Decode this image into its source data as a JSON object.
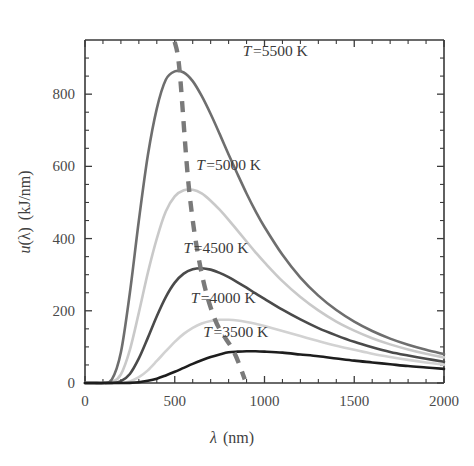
{
  "figure": {
    "background": "#ffffff",
    "plot_box": {
      "left": 85,
      "top": 40,
      "right": 444,
      "bottom": 383
    }
  },
  "axes": {
    "x_title_var": "λ",
    "x_title_unit": "(nm)",
    "y_title": "u(λ)  (kJ/nm)",
    "y_title_var": "u",
    "y_title_arg": "(λ)",
    "y_title_unit": "(kJ/nm)",
    "x_ticklabels": [
      "0",
      "500",
      "1000",
      "1500",
      "2000"
    ],
    "y_ticklabels": [
      "0",
      "200",
      "400",
      "600",
      "800"
    ]
  },
  "chart_data": {
    "type": "line",
    "title": "",
    "xlabel": "λ (nm)",
    "ylabel": "u(λ) (kJ/nm)",
    "xlim": [
      0,
      2000
    ],
    "ylim": [
      0,
      950
    ],
    "xticks": [
      0,
      500,
      1000,
      1500,
      2000
    ],
    "yticks": [
      0,
      200,
      400,
      600,
      800
    ],
    "x_minor_tick_step": 100,
    "y_minor_tick_step": 50,
    "grid": false,
    "legend": "inline-annotations",
    "x": [
      0,
      50,
      100,
      150,
      200,
      250,
      300,
      350,
      400,
      450,
      500,
      550,
      600,
      650,
      700,
      750,
      800,
      850,
      900,
      950,
      1000,
      1100,
      1200,
      1300,
      1400,
      1500,
      1600,
      1700,
      1800,
      1900,
      2000
    ],
    "series": [
      {
        "name": "T=5500 K",
        "temperature_K": 5500,
        "color": "#6e6e6e",
        "linewidth": 2.6,
        "peak": {
          "x": 527,
          "y": 865
        },
        "label": "T = 5500 K",
        "label_pos": {
          "x": 1060,
          "y": 905
        },
        "values": [
          0,
          0,
          0.2,
          10,
          85,
          250,
          450,
          630,
          760,
          840,
          863,
          860,
          836,
          795,
          745,
          690,
          633,
          578,
          525,
          476,
          432,
          355,
          292,
          242,
          202,
          170,
          144,
          123,
          106,
          92,
          80
        ]
      },
      {
        "name": "T=5000 K",
        "temperature_K": 5000,
        "color": "#c9c9c9",
        "linewidth": 2.6,
        "peak": {
          "x": 580,
          "y": 535
        },
        "label": "T = 5000 K",
        "label_pos": {
          "x": 800,
          "y": 590
        },
        "values": [
          0,
          0,
          0.02,
          2,
          24,
          92,
          195,
          305,
          400,
          475,
          517,
          534,
          535,
          525,
          505,
          480,
          452,
          422,
          392,
          362,
          334,
          282,
          238,
          201,
          170,
          145,
          124,
          107,
          93,
          81,
          71
        ]
      },
      {
        "name": "T=4500 K",
        "temperature_K": 4500,
        "color": "#4a4a4a",
        "linewidth": 2.6,
        "peak": {
          "x": 644,
          "y": 318
        },
        "label": "T = 4500 K",
        "label_pos": {
          "x": 730,
          "y": 360
        },
        "values": [
          0,
          0,
          0.001,
          0.3,
          5,
          25,
          68,
          125,
          185,
          238,
          278,
          303,
          315,
          318,
          314,
          305,
          293,
          279,
          264,
          248,
          233,
          203,
          176,
          152,
          132,
          114,
          99,
          86,
          76,
          67,
          59
        ]
      },
      {
        "name": "T=4000 K",
        "temperature_K": 4000,
        "color": "#d2d2d2",
        "linewidth": 2.6,
        "peak": {
          "x": 725,
          "y": 175
        },
        "label": "T = 4000 K",
        "label_pos": {
          "x": 770,
          "y": 222
        },
        "values": [
          0,
          0,
          0,
          0.02,
          0.6,
          4.5,
          16,
          35,
          61,
          88,
          114,
          136,
          153,
          165,
          172,
          175,
          175,
          173,
          169,
          164,
          158,
          144,
          130,
          116,
          103,
          92,
          81,
          72,
          64,
          57,
          51
        ]
      },
      {
        "name": "T=3500 K",
        "temperature_K": 3500,
        "color": "#1d1d1d",
        "linewidth": 2.6,
        "peak": {
          "x": 828,
          "y": 88
        },
        "label": "T = 3500 K",
        "label_pos": {
          "x": 840,
          "y": 128
        },
        "values": [
          0,
          0,
          0,
          0,
          0.04,
          0.4,
          2,
          6,
          12,
          21,
          31,
          42,
          53,
          63,
          72,
          79,
          85,
          87,
          88,
          88,
          87,
          84,
          79,
          74,
          68,
          62,
          57,
          52,
          47,
          43,
          39
        ]
      }
    ],
    "annotations": [
      {
        "name": "wien-displacement-line",
        "style": "dashed",
        "color": "#7a7a7a",
        "description": "Wien displacement locus through spectral peaks",
        "points": [
          {
            "x": 500,
            "y": 945
          },
          {
            "x": 527,
            "y": 865
          },
          {
            "x": 580,
            "y": 535
          },
          {
            "x": 644,
            "y": 318
          },
          {
            "x": 725,
            "y": 175
          },
          {
            "x": 828,
            "y": 88
          },
          {
            "x": 890,
            "y": 10
          }
        ]
      }
    ]
  }
}
